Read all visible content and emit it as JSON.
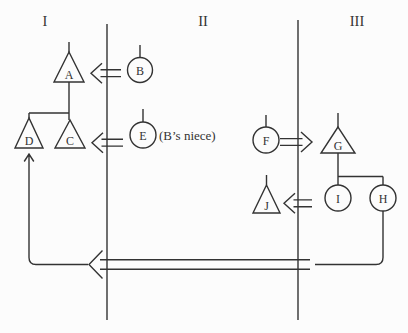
{
  "colors": {
    "ink": "#333333",
    "paper": "#fcfcfc"
  },
  "columns": [
    {
      "numeral": "I"
    },
    {
      "numeral": "II"
    },
    {
      "numeral": "III"
    }
  ],
  "persons": {
    "A": {
      "label": "A",
      "shape": "triangle"
    },
    "B": {
      "label": "B",
      "shape": "circle"
    },
    "C": {
      "label": "C",
      "shape": "triangle"
    },
    "D": {
      "label": "D",
      "shape": "triangle"
    },
    "E": {
      "label": "E",
      "shape": "circle",
      "note": "(B’s niece)"
    },
    "F": {
      "label": "F",
      "shape": "circle"
    },
    "G": {
      "label": "G",
      "shape": "triangle"
    },
    "H": {
      "label": "H",
      "shape": "circle"
    },
    "I": {
      "label": "I",
      "shape": "circle"
    },
    "J": {
      "label": "J",
      "shape": "triangle"
    }
  }
}
